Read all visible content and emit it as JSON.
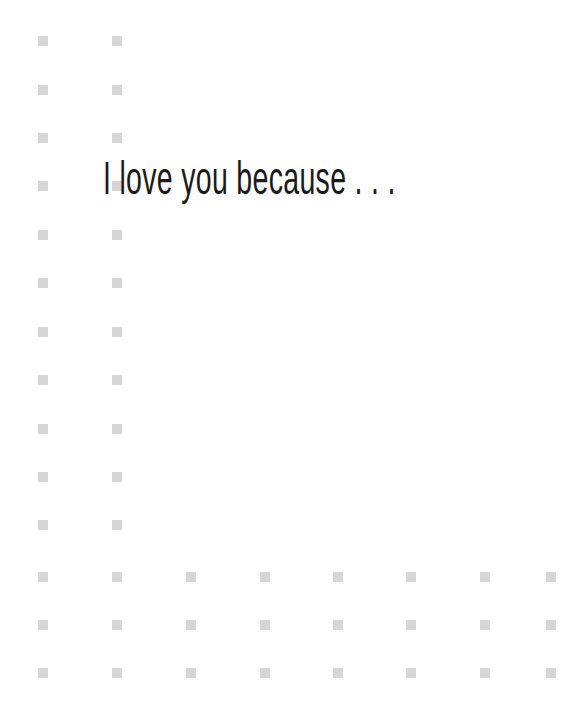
{
  "page": {
    "background_color": "#ffffff",
    "width": 588,
    "height": 710
  },
  "headline": {
    "text": "I love you because . . .",
    "color": "#1c1a1a"
  },
  "decoration": {
    "name": "square-dot-grid",
    "square_color": "#d6d6d6",
    "square_size": 10,
    "column_x": [
      38,
      112,
      186,
      260,
      333,
      406,
      480,
      546
    ],
    "row_y": [
      36,
      85,
      133,
      181,
      230,
      278,
      327,
      375,
      424,
      472,
      520,
      572,
      620,
      668
    ],
    "full_width_rows": [
      11,
      12,
      13
    ],
    "left_columns": [
      0,
      1
    ]
  }
}
